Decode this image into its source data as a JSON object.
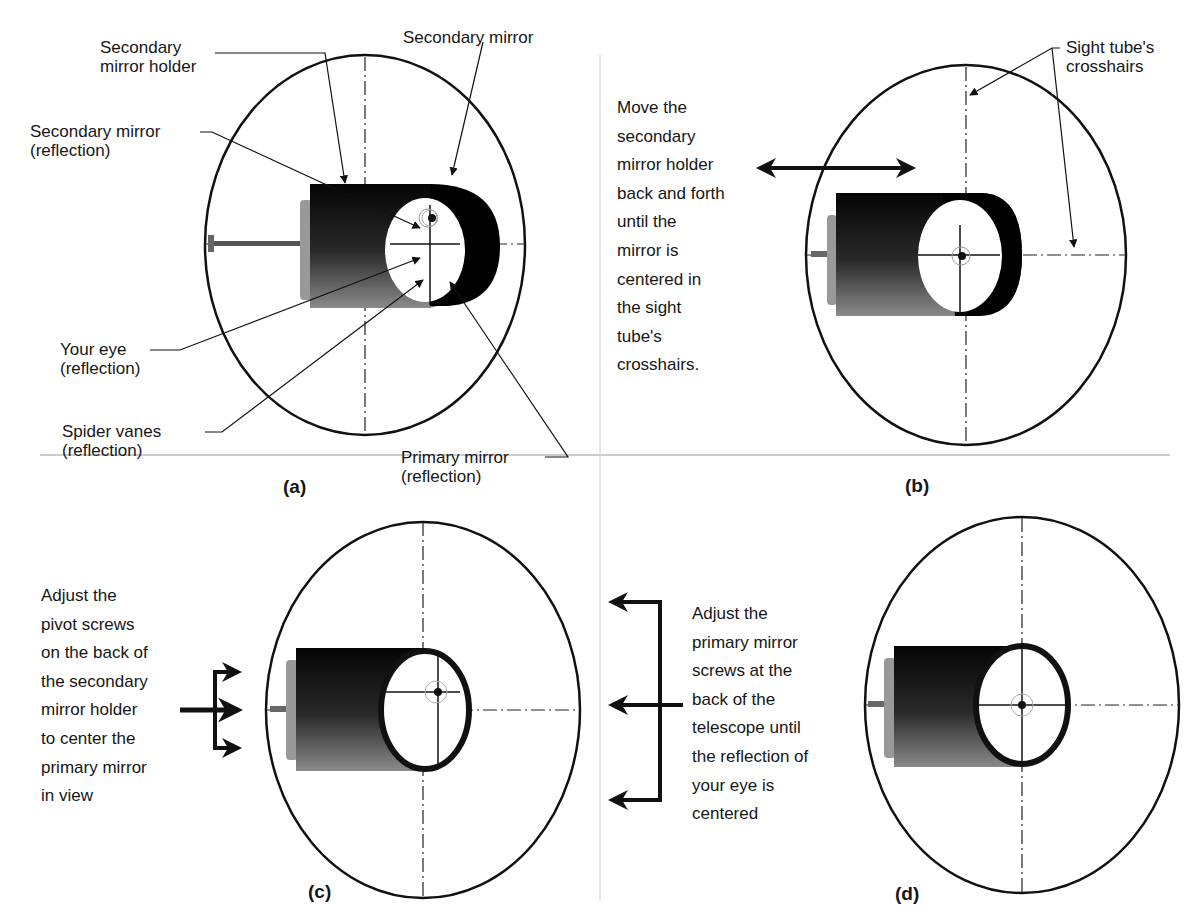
{
  "panels": {
    "a": {
      "caption": "(a)",
      "labels": {
        "secondary_mirror_holder": "Secondary\nmirror holder",
        "secondary_mirror": "Secondary mirror",
        "secondary_mirror_reflection": "Secondary mirror\n(reflection)",
        "your_eye_reflection": "Your eye\n(reflection)",
        "spider_vanes_reflection": "Spider vanes\n(reflection)",
        "primary_mirror_reflection": "Primary mirror\n(reflection)"
      }
    },
    "b": {
      "caption": "(b)",
      "labels": {
        "sight_tube_crosshairs": "Sight tube's\ncrosshairs",
        "instruction": "Move the\nsecondary\nmirror holder\nback and forth\nuntil the\nmirror is\ncentered in\nthe sight\ntube's\ncrosshairs."
      }
    },
    "c": {
      "caption": "(c)",
      "labels": {
        "instruction": "Adjust the\npivot screws\non the back of\nthe secondary\nmirror holder\nto center the\nprimary mirror\nin view"
      }
    },
    "d": {
      "caption": "(d)",
      "labels": {
        "instruction": "Adjust the\nprimary mirror\nscrews at the\nback of the\ntelescope until\nthe reflection of\nyour eye is\ncentered"
      }
    }
  },
  "colors": {
    "ink": "#111111",
    "holder_dark": "#0a0a0a",
    "holder_light": "#7a7a7a",
    "divider": "#bbbbbb"
  }
}
